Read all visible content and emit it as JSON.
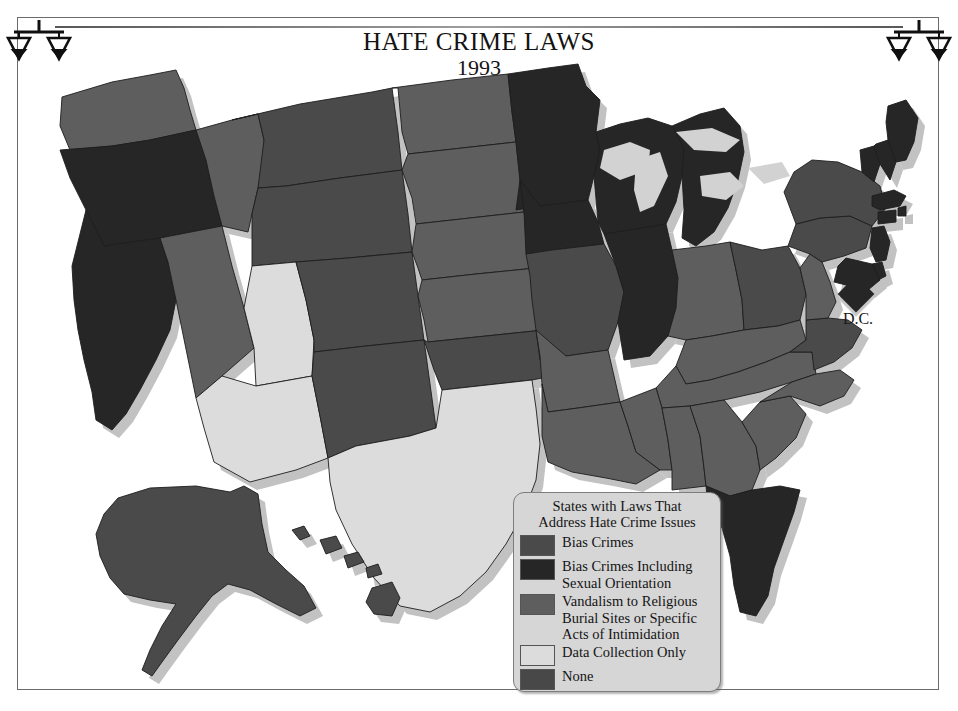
{
  "page": {
    "title": "HATE CRIME LAWS",
    "year": "1993"
  },
  "icons": {
    "scales_left": "scales-of-justice-icon",
    "scales_right": "scales-of-justice-icon"
  },
  "dc": {
    "label": "D.C.",
    "color": "#262626"
  },
  "legend": {
    "title": "States with Laws That\nAddress Hate Crime Issues",
    "items": [
      {
        "label": "Bias Crimes",
        "color": "#4a4a4a"
      },
      {
        "label": "Bias Crimes Including\nSexual Orientation",
        "color": "#262626"
      },
      {
        "label": "Vandalism to Religious\nBurial Sites or Specific\nActs of Intimidation",
        "color": "#5e5e5e"
      },
      {
        "label": "Data Collection Only",
        "color": "#dcdcdc"
      },
      {
        "label": "None",
        "color": "#484848"
      }
    ]
  },
  "chart_data": {
    "type": "map",
    "title": "HATE CRIME LAWS",
    "subtitle": "1993",
    "legend_title": "States with Laws That Address Hate Crime Issues",
    "categories": [
      {
        "key": "bias",
        "label": "Bias Crimes",
        "color": "#4a4a4a"
      },
      {
        "key": "bias_so",
        "label": "Bias Crimes Including Sexual Orientation",
        "color": "#262626"
      },
      {
        "key": "vandalism",
        "label": "Vandalism to Religious Burial Sites or Specific Acts of Intimidation",
        "color": "#5e5e5e"
      },
      {
        "key": "data",
        "label": "Data Collection Only",
        "color": "#dcdcdc"
      },
      {
        "key": "none",
        "label": "None",
        "color": "#484848"
      }
    ],
    "values": {
      "AL": "vandalism",
      "AK": "bias",
      "AZ": "data",
      "AR": "vandalism",
      "CA": "bias_so",
      "CO": "bias",
      "CT": "bias_so",
      "DE": "bias_so",
      "DC": "bias_so",
      "FL": "bias_so",
      "GA": "vandalism",
      "HI": "bias",
      "ID": "vandalism",
      "IL": "bias_so",
      "IN": "vandalism",
      "IA": "bias_so",
      "KS": "vandalism",
      "KY": "vandalism",
      "LA": "vandalism",
      "ME": "bias_so",
      "MD": "bias_so",
      "MA": "bias_so",
      "MI": "bias_so",
      "MN": "bias_so",
      "MS": "vandalism",
      "MO": "bias",
      "MT": "bias",
      "NE": "vandalism",
      "NV": "vandalism",
      "NH": "bias_so",
      "NJ": "bias_so",
      "NM": "bias",
      "NY": "bias",
      "NC": "vandalism",
      "ND": "vandalism",
      "OH": "bias",
      "OK": "bias",
      "OR": "bias_so",
      "PA": "bias",
      "RI": "bias_so",
      "SC": "vandalism",
      "SD": "vandalism",
      "TN": "vandalism",
      "TX": "data",
      "UT": "data",
      "VT": "bias_so",
      "VA": "bias",
      "WA": "vandalism",
      "WV": "vandalism",
      "WI": "bias_so",
      "WY": "bias"
    }
  }
}
